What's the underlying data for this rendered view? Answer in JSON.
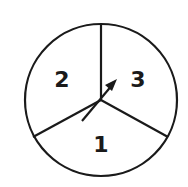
{
  "diagram": {
    "type": "spinner",
    "stroke_color": "#1a1a1a",
    "background": "#ffffff",
    "sections": [
      {
        "label": "2",
        "position": "upper-left"
      },
      {
        "label": "3",
        "position": "upper-right"
      },
      {
        "label": "1",
        "position": "bottom"
      }
    ],
    "arrow": {
      "points_toward": "3"
    }
  }
}
